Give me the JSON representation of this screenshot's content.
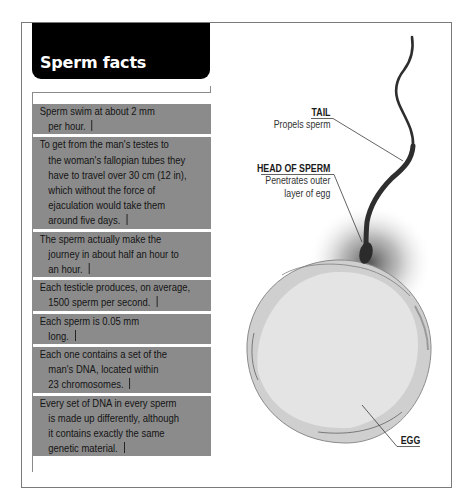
{
  "header": {
    "title": "Sperm facts"
  },
  "facts": [
    {
      "lines": [
        "Sperm swim at about 2 mm",
        "per hour."
      ]
    },
    {
      "lines": [
        "To get from the man's testes to",
        "the woman's fallopian tubes they",
        "have to travel over 30 cm (12 in),",
        "which without the force of",
        "ejaculation would take them",
        "around five days."
      ]
    },
    {
      "lines": [
        "The sperm actually make the",
        "journey in about half an hour to",
        "an hour."
      ]
    },
    {
      "lines": [
        "Each testicle produces, on average,",
        "1500 sperm per second."
      ]
    },
    {
      "lines": [
        "Each sperm is 0.05 mm",
        "long."
      ]
    },
    {
      "lines": [
        "Each one contains a set of the",
        "man's DNA, located within",
        "23 chromosomes."
      ]
    },
    {
      "lines": [
        "Every set of DNA in every sperm",
        "is made up differently, although",
        "it contains exactly the same",
        "genetic material."
      ]
    }
  ],
  "diagram": {
    "labels": {
      "tail": {
        "title": "TAIL",
        "desc": "Propels sperm"
      },
      "head": {
        "title": "HEAD OF SPERM",
        "desc_lines": [
          "Penetrates outer",
          "layer of egg"
        ]
      },
      "egg": {
        "title": "EGG"
      }
    }
  },
  "colors": {
    "header_bg": "#000000",
    "fact_bg": "#8b8b8b",
    "fact_text": "#141414",
    "sperm": "#2e2e2e",
    "egg_fill": "#e3e3e3",
    "egg_rim": "#cdcdcd"
  }
}
